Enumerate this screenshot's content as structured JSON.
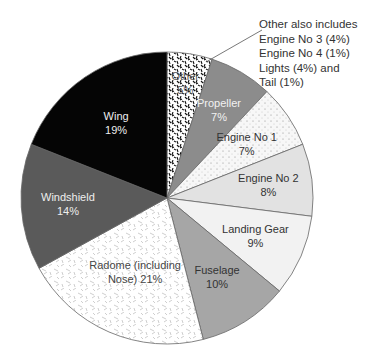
{
  "chart_data": {
    "type": "pie",
    "title": "",
    "start_angle_deg": 0,
    "direction": "clockwise",
    "categories": [
      "Other",
      "Propeller",
      "Engine No 1",
      "Engine No 2",
      "Landing Gear",
      "Fuselage",
      "Radome (including Nose)",
      "Windshield",
      "Wing"
    ],
    "values": [
      5,
      7,
      7,
      8,
      9,
      10,
      21,
      14,
      19
    ],
    "unit": "%",
    "slices": [
      {
        "name": "Other",
        "label_lines": [
          "Other",
          "5%"
        ],
        "value": 5,
        "fill": "#ffffff",
        "pattern": "squiggle-dark",
        "text_color": "#555555"
      },
      {
        "name": "Propeller",
        "label_lines": [
          "Propeller",
          "7%"
        ],
        "value": 7,
        "fill": "#8c8c8c",
        "pattern": "none",
        "text_color": "#f2f2f2"
      },
      {
        "name": "Engine No 1",
        "label_lines": [
          "Engine No 1",
          "7%"
        ],
        "value": 7,
        "fill": "#f7f7f7",
        "pattern": "dots",
        "text_color": "#333333"
      },
      {
        "name": "Engine No 2",
        "label_lines": [
          "Engine No 2",
          "8%"
        ],
        "value": 8,
        "fill": "#e2e2e2",
        "pattern": "none",
        "text_color": "#333333"
      },
      {
        "name": "Landing Gear",
        "label_lines": [
          "Landing Gear",
          "9%"
        ],
        "value": 9,
        "fill": "#f2f2f2",
        "pattern": "none",
        "text_color": "#333333"
      },
      {
        "name": "Fuselage",
        "label_lines": [
          "Fuselage",
          "10%"
        ],
        "value": 10,
        "fill": "#a6a6a6",
        "pattern": "none",
        "text_color": "#333333"
      },
      {
        "name": "Radome (including Nose)",
        "label_lines": [
          "Radome (including",
          "Nose) 21%"
        ],
        "value": 21,
        "fill": "#ffffff",
        "pattern": "dashes-light",
        "text_color": "#444444"
      },
      {
        "name": "Windshield",
        "label_lines": [
          "Windshield",
          "14%"
        ],
        "value": 14,
        "fill": "#5a5a5a",
        "pattern": "none",
        "text_color": "#eeeeee"
      },
      {
        "name": "Wing",
        "label_lines": [
          "Wing",
          "19%"
        ],
        "value": 19,
        "fill": "#050505",
        "pattern": "none",
        "text_color": "#eeeeee"
      }
    ],
    "annotation": {
      "lines": [
        "Other also includes",
        "Engine No 3 (4%)",
        "Engine No 4 (1%)",
        "Lights (4%) and",
        "Tail (1%)"
      ]
    },
    "legend": "none",
    "grid": false
  }
}
